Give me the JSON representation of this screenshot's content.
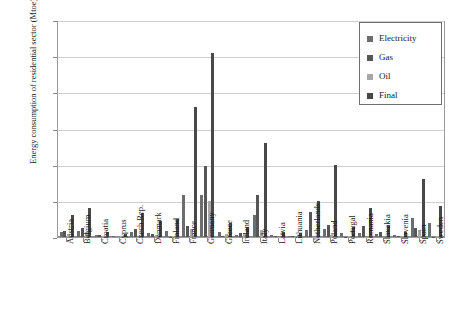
{
  "chart_data": {
    "type": "bar",
    "title": "",
    "xlabel": "",
    "ylabel": "Energy consumption of residential sector (Mtoe)",
    "ylim": [
      0,
      60
    ],
    "yticks": [
      0,
      10,
      20,
      30,
      40,
      50,
      60
    ],
    "grid": true,
    "legend_position": "top-right",
    "categories": [
      "Austria",
      "Belgium",
      "Croatia",
      "Cyprus",
      "Czech Rep.",
      "Denmark",
      "Finland",
      "France",
      "Germany",
      "Greece",
      "Ireland",
      "Italy",
      "Latvia",
      "Lithuania",
      "Netherlands",
      "Poland",
      "Portugal",
      "Romania",
      "Slovakia",
      "Slovenia",
      "Spain",
      "Sweden"
    ],
    "series": [
      {
        "name": "Electricity",
        "color": "#6d6d6d",
        "values": [
          1.3,
          1.6,
          0.5,
          0.4,
          1.3,
          1.1,
          1.7,
          11.5,
          11.6,
          1.5,
          0.6,
          6.0,
          0.5,
          0.3,
          2.0,
          2.3,
          1.1,
          1.0,
          0.9,
          0.6,
          5.2,
          3.9
        ]
      },
      {
        "name": "Gas",
        "color": "#565656",
        "values": [
          1.6,
          2.6,
          0.6,
          0.0,
          2.2,
          0.8,
          0.1,
          3.0,
          19.5,
          0.4,
          1.0,
          11.5,
          0.2,
          0.2,
          7.0,
          3.2,
          0.1,
          3.0,
          1.3,
          0.4,
          2.4,
          0.1
        ]
      },
      {
        "name": "Oil",
        "color": "#a8a8a8",
        "values": [
          0.9,
          1.4,
          0.2,
          0.3,
          0.1,
          0.5,
          0.3,
          2.2,
          10.0,
          0.9,
          0.9,
          1.9,
          0.1,
          0.1,
          0.1,
          0.5,
          0.2,
          0.1,
          0.1,
          0.3,
          1.9,
          0.3
        ]
      },
      {
        "name": "Final",
        "color": "#484848",
        "values": [
          6.0,
          8.0,
          1.5,
          0.8,
          6.6,
          4.5,
          4.9,
          36.0,
          51.0,
          3.9,
          2.8,
          26.0,
          1.4,
          1.2,
          10.0,
          19.8,
          2.7,
          8.0,
          3.0,
          1.3,
          16.0,
          8.5
        ]
      }
    ]
  },
  "legend": {
    "items": [
      {
        "label": "Electricity",
        "color": "#6d6d6d"
      },
      {
        "label": "Gas",
        "color": "#565656"
      },
      {
        "label": "Oil",
        "color": "#a8a8a8"
      },
      {
        "label": "Final",
        "color": "#484848"
      }
    ]
  }
}
